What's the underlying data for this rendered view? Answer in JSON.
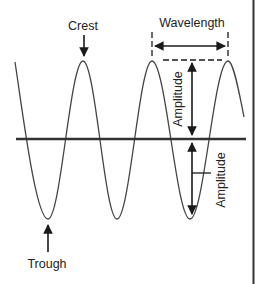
{
  "diagram": {
    "colors": {
      "background": "#ffffff",
      "wave": "#444444",
      "axis": "#333333",
      "arrow": "#1a1a1a",
      "text": "#222222",
      "border": "#333333"
    },
    "axis": {
      "x1": 16,
      "x2": 246,
      "y": 139,
      "width": 2.6
    },
    "wave": {
      "start": {
        "x": 15,
        "y": 62
      },
      "extrema": [
        {
          "type": "trough",
          "x": 48,
          "y": 219
        },
        {
          "type": "crest",
          "x": 83,
          "y": 61
        },
        {
          "type": "trough",
          "x": 117,
          "y": 219
        },
        {
          "type": "crest",
          "x": 152,
          "y": 61
        },
        {
          "type": "trough",
          "x": 190,
          "y": 219
        },
        {
          "type": "crest",
          "x": 228,
          "y": 61
        }
      ],
      "end": {
        "x": 244,
        "y": 117
      }
    },
    "labels": {
      "crest": "Crest",
      "trough": "Trough",
      "wavelength": "Wavelength",
      "amplitude_upper": "Amplitude",
      "amplitude_lower": "Amplitude"
    },
    "right_border": {
      "x": 253
    }
  }
}
